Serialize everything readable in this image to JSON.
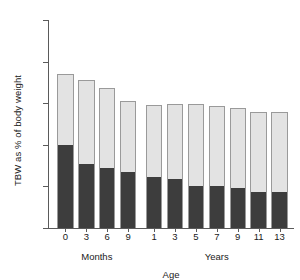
{
  "chart_data": {
    "type": "bar",
    "title": "",
    "subtitle": "",
    "xlabel": "Age",
    "ylabel": "TBW as % of body weight",
    "grid": false,
    "legend_position": "none",
    "stacked": true,
    "ylim": [
      0,
      100
    ],
    "yticks": [
      0,
      20,
      40,
      60,
      80,
      100
    ],
    "ytick_labels": [
      "0",
      "20",
      "40",
      "60",
      "80",
      "100"
    ],
    "categories": [
      "0",
      "3",
      "6",
      "9",
      "1",
      "3",
      "5",
      "7",
      "9",
      "11",
      "13"
    ],
    "group_labels": [
      {
        "label": "Months",
        "start_index": 0,
        "end_index": 3
      },
      {
        "label": "Years",
        "start_index": 4,
        "end_index": 10
      }
    ],
    "series": [
      {
        "name": "intracellular",
        "color": "#3d3d3d",
        "values": [
          40.0,
          31.0,
          29.0,
          27.0,
          24.5,
          23.5,
          20.0,
          20.0,
          19.0,
          17.5,
          17.5
        ]
      },
      {
        "name": "extracellular",
        "color": "#e3e3e3",
        "values": [
          34.0,
          40.0,
          38.5,
          34.0,
          34.5,
          36.0,
          39.5,
          38.5,
          38.5,
          38.5,
          38.5
        ]
      }
    ],
    "totals": [
      74.0,
      71.0,
      67.5,
      61.0,
      59.0,
      59.5,
      59.5,
      58.5,
      57.5,
      56.0,
      56.0
    ]
  },
  "style": {
    "axis_color": "#5a5a5a",
    "bar_edge_color": "#9a9a9a",
    "background": "#ffffff"
  }
}
